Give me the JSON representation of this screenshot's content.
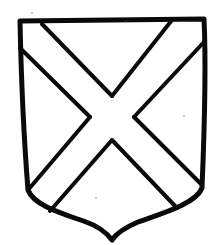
{
  "figure": {
    "subject": "Heraldic shield with a saltire",
    "charge": "saltire",
    "ink_color": "#0a0a0a",
    "field_color": "#ffffff"
  }
}
